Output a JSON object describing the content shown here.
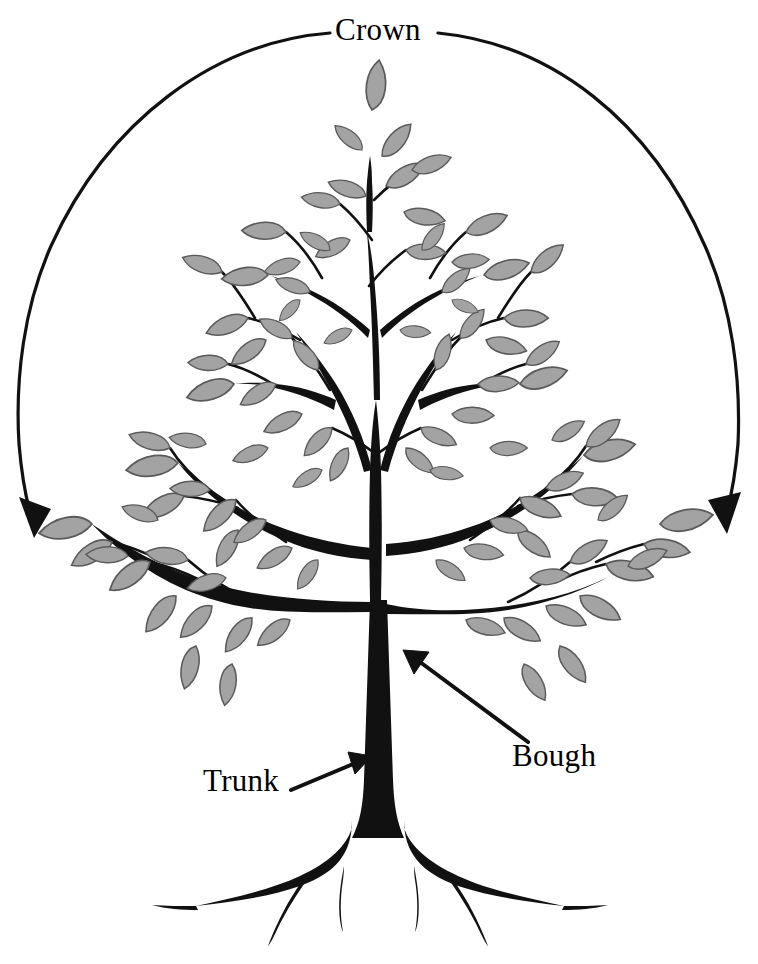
{
  "figure": {
    "type": "labeled-botanical-diagram",
    "background_color": "#ffffff",
    "ink_color": "#111111",
    "leaf_fill_color": "#a3a3a3",
    "leaf_stroke_color": "#5a5a5a",
    "width": 758,
    "height": 964
  },
  "labels": {
    "crown": "Crown",
    "bough": "Bough",
    "trunk": "Trunk"
  },
  "annotations": [
    {
      "id": "crown",
      "label": "Crown",
      "kind": "span-arc",
      "description": "double-headed arc spanning the full canopy width, broken at top center for the text",
      "arrowheads": [
        "left-bottom",
        "right-bottom"
      ]
    },
    {
      "id": "bough",
      "label": "Bough",
      "kind": "leader-arrow",
      "description": "straight arrow pointing up-left to the lowest major limb",
      "arrowheads": [
        "up-left"
      ]
    },
    {
      "id": "trunk",
      "label": "Trunk",
      "kind": "leader-arrow",
      "description": "straight arrow pointing up-right to the main stem",
      "arrowheads": [
        "up-right"
      ]
    }
  ],
  "parts": [
    {
      "name": "crown",
      "label": "Crown"
    },
    {
      "name": "bough",
      "label": "Bough"
    },
    {
      "name": "trunk",
      "label": "Trunk"
    }
  ],
  "caption": ""
}
